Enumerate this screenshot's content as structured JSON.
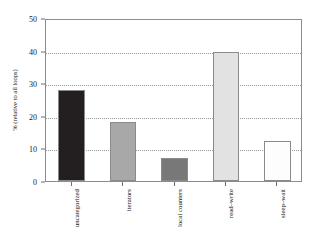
{
  "chart_data": {
    "type": "bar",
    "title": "",
    "subtitle": "",
    "xlabel": "",
    "ylabel": "% (relative to all loops)",
    "categories": [
      "uncategorized",
      "iterators",
      "local counters",
      "read–write",
      "sleep–wait"
    ],
    "values": [
      27.8,
      18.2,
      7.2,
      39.5,
      12.4
    ],
    "bar_colors": [
      "#231f20",
      "#a8a8a8",
      "#787878",
      "#e2e2e2",
      "#fdfdfd"
    ],
    "bar_edge_color": "#8a8a8a",
    "ylim": [
      0,
      50
    ],
    "yticks": [
      0,
      10,
      20,
      30,
      40,
      50
    ],
    "ytick_labels": [
      "0",
      "10",
      "20",
      "30",
      "40",
      "50"
    ],
    "grid": true,
    "grid_axis": "y",
    "grid_style": "dotted",
    "grid_color": "#9a9a9a",
    "legend": false,
    "legend_position": "none",
    "frame_color": "#8c8c8c",
    "background": "#ffffff"
  }
}
